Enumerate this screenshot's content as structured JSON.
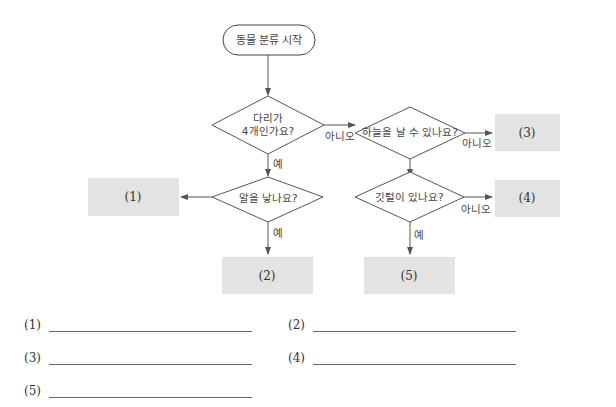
{
  "flowchart": {
    "start": "동물 분류 시작",
    "decisions": {
      "legs": "다리가\n4개인가요?",
      "fly": "하늘을 날 수 있나요?",
      "eggs": "알을 낳나요?",
      "feathers": "깃털이 있나요?"
    },
    "edge_labels": {
      "yes": "예",
      "no": "아니오"
    },
    "boxes": [
      "(1)",
      "(2)",
      "(3)",
      "(4)",
      "(5)"
    ],
    "colors": {
      "box_fill": "#e3e3e3",
      "line": "#555555"
    }
  },
  "answers": [
    {
      "label": "(1)"
    },
    {
      "label": "(2)"
    },
    {
      "label": "(3)"
    },
    {
      "label": "(4)"
    },
    {
      "label": "(5)"
    }
  ]
}
